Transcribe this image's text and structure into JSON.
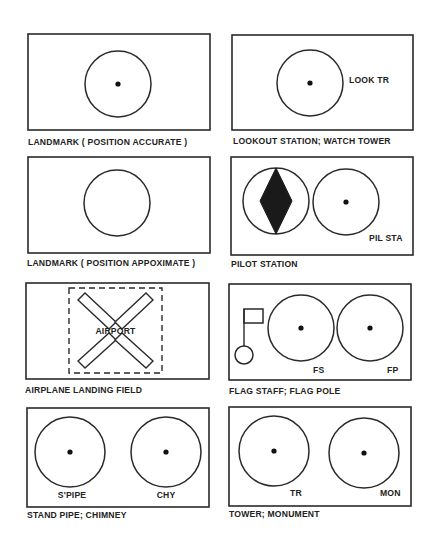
{
  "panels": [
    {
      "id": "landmark-accurate",
      "caption": "LANDMARK ( POSITION ACCURATE )",
      "symbols": [
        {
          "type": "circle-dot",
          "label": ""
        }
      ]
    },
    {
      "id": "lookout-station",
      "caption": "LOOKOUT STATION; WATCH TOWER",
      "symbols": [
        {
          "type": "circle-dot",
          "label": "LOOK TR"
        }
      ]
    },
    {
      "id": "landmark-approximate",
      "caption": "LANDMARK ( POSITION APPOXIMATE )",
      "symbols": [
        {
          "type": "circle",
          "label": ""
        }
      ]
    },
    {
      "id": "pilot-station",
      "caption": "PILOT STATION",
      "symbols": [
        {
          "type": "circle-diamond",
          "label": ""
        },
        {
          "type": "circle-dot",
          "label": "PIL STA"
        }
      ]
    },
    {
      "id": "airplane-landing-field",
      "caption": "AIRPLANE LANDING FIELD",
      "symbols": [
        {
          "type": "airport-x",
          "label": "AIRPORT"
        }
      ]
    },
    {
      "id": "flag-staff",
      "caption": "FLAG STAFF; FLAG POLE",
      "symbols": [
        {
          "type": "flag",
          "label": ""
        },
        {
          "type": "circle-dot",
          "label": "FS"
        },
        {
          "type": "circle-dot",
          "label": "FP"
        }
      ]
    },
    {
      "id": "stand-pipe",
      "caption": "STAND PIPE; CHIMNEY",
      "symbols": [
        {
          "type": "circle-dot",
          "label": "S'PIPE"
        },
        {
          "type": "circle-dot",
          "label": "CHY"
        }
      ]
    },
    {
      "id": "tower-monument",
      "caption": "TOWER; MONUMENT",
      "symbols": [
        {
          "type": "circle-dot",
          "label": "TR"
        },
        {
          "type": "circle-dot",
          "label": "MON"
        }
      ]
    }
  ],
  "colors": {
    "ink": "#1a1a1a",
    "paper": "#ffffff"
  }
}
